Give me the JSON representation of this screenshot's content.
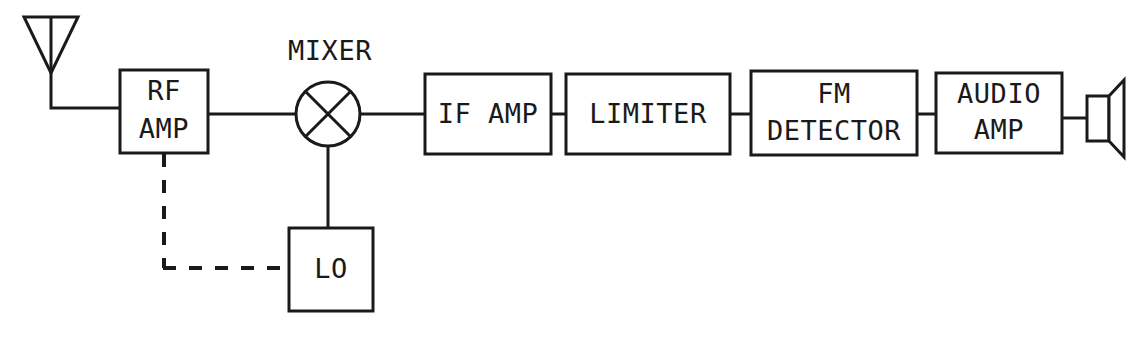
{
  "diagram": {
    "background_color": "#ffffff",
    "line_color": "#1a1a1a",
    "blocks": [
      {
        "id": "rf-amp",
        "line1": "RF",
        "line2": "AMP"
      },
      {
        "id": "if-amp",
        "line1": "IF AMP",
        "line2": ""
      },
      {
        "id": "limiter",
        "line1": "LIMITER",
        "line2": ""
      },
      {
        "id": "fm-detector",
        "line1": "FM",
        "line2": "DETECTOR"
      },
      {
        "id": "audio-amp",
        "line1": "AUDIO",
        "line2": "AMP"
      },
      {
        "id": "lo",
        "line1": "LO",
        "line2": ""
      }
    ],
    "labels": {
      "mixer": "MIXER"
    },
    "symbols": {
      "antenna": "antenna-icon",
      "mixer": "mixer-circle-icon",
      "speaker": "speaker-icon"
    },
    "signal_path": [
      "antenna",
      "RF AMP",
      "MIXER",
      "IF AMP",
      "LIMITER",
      "FM DETECTOR",
      "AUDIO AMP",
      "speaker"
    ],
    "control_path": [
      "LO",
      "MIXER"
    ],
    "tuning_link": [
      "LO",
      "RF AMP"
    ]
  }
}
